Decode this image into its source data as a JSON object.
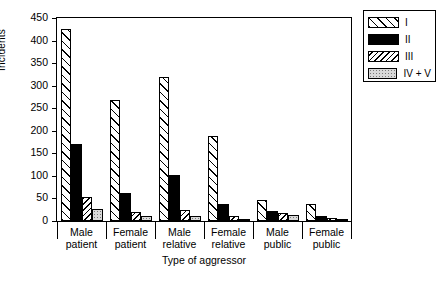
{
  "chart_data": {
    "type": "bar",
    "title": "",
    "xlabel": "Type of aggressor",
    "ylabel": "Incidents",
    "ylim": [
      0,
      450
    ],
    "yticks": [
      0,
      50,
      100,
      150,
      200,
      250,
      300,
      350,
      400,
      450
    ],
    "grid": false,
    "legend_position": "top-right",
    "categories": [
      "Male patient",
      "Female patient",
      "Male relative",
      "Female relative",
      "Male public",
      "Female public"
    ],
    "category_lines": [
      [
        "Male",
        "patient"
      ],
      [
        "Female",
        "patient"
      ],
      [
        "Male",
        "relative"
      ],
      [
        "Female",
        "relative"
      ],
      [
        "Male",
        "public"
      ],
      [
        "Female",
        "public"
      ]
    ],
    "series": [
      {
        "name": "I",
        "pattern": "diagonal-hatch-wide",
        "values": [
          425,
          269,
          319,
          188,
          47,
          38
        ]
      },
      {
        "name": "II",
        "pattern": "solid-black",
        "values": [
          170,
          61,
          103,
          37,
          22,
          12
        ]
      },
      {
        "name": "III",
        "pattern": "diagonal-hatch-fine",
        "values": [
          53,
          19,
          25,
          12,
          18,
          7
        ]
      },
      {
        "name": "IV + V",
        "pattern": "light-gray-stipple",
        "values": [
          26,
          12,
          12,
          4,
          13,
          4
        ]
      }
    ]
  },
  "legend": {
    "items": [
      {
        "label": "I"
      },
      {
        "label": "II"
      },
      {
        "label": "III"
      },
      {
        "label": "IV + V"
      }
    ]
  }
}
